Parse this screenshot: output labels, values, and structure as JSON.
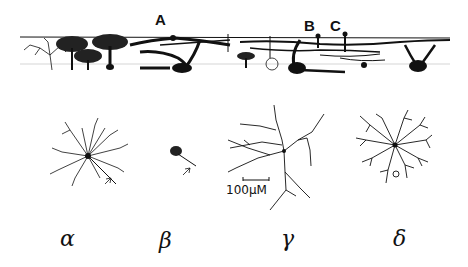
{
  "figure": {
    "type": "neuron morphology illustration",
    "top_panel": {
      "description": "cross-section of retina showing cells with dendritic arbors",
      "labels": [
        "A",
        "B",
        "C"
      ]
    },
    "cells": [
      {
        "name": "alpha",
        "label": "α"
      },
      {
        "name": "beta",
        "label": "β"
      },
      {
        "name": "gamma",
        "label": "γ"
      },
      {
        "name": "delta",
        "label": "δ"
      }
    ],
    "scale_bar": {
      "label": "100µM"
    }
  }
}
